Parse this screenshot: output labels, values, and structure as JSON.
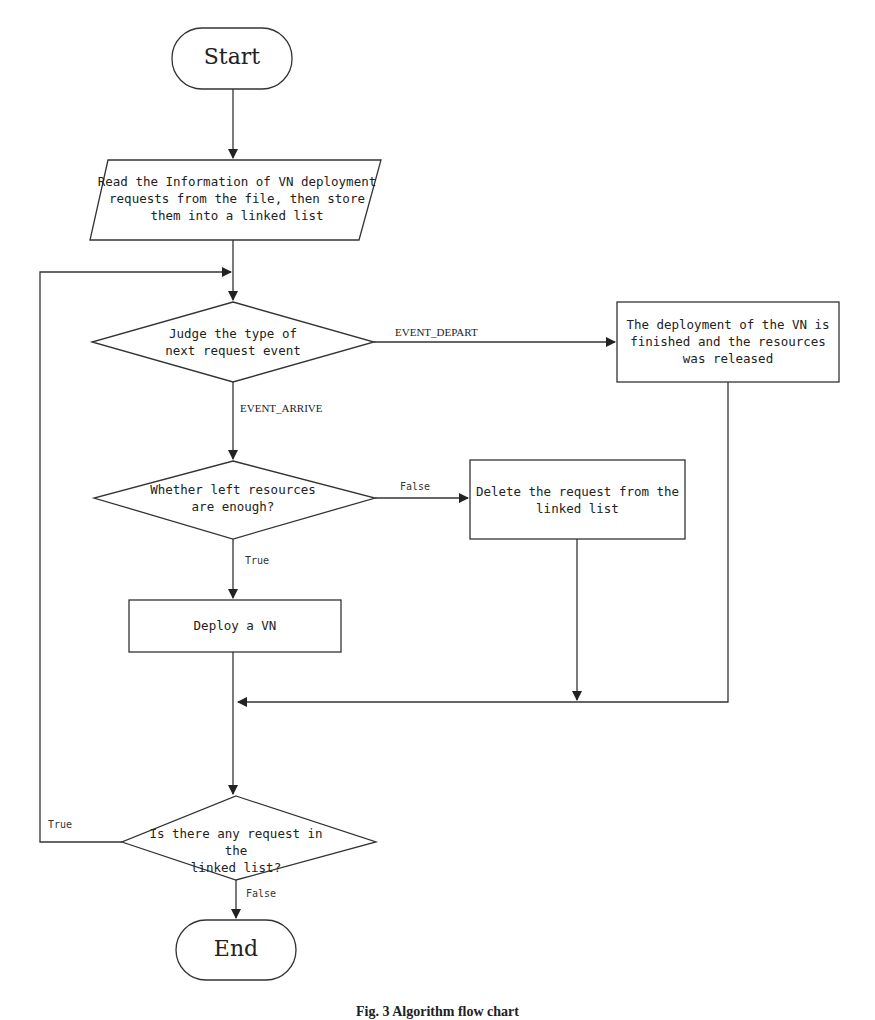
{
  "nodes": {
    "start": {
      "label": "Start",
      "type": "terminal"
    },
    "read": {
      "label": "Read the Information of VN deployment\nrequests from the file, then store\nthem into a linked list",
      "type": "io"
    },
    "judge": {
      "label": "Judge the type of\nnext request event",
      "type": "decision"
    },
    "released": {
      "label": "The deployment of the VN is\nfinished and the resources\nwas released",
      "type": "process"
    },
    "enough": {
      "label": "Whether left resources\nare enough?",
      "type": "decision"
    },
    "delete": {
      "label": "Delete the request from the\nlinked list",
      "type": "process"
    },
    "deploy": {
      "label": "Deploy a VN",
      "type": "process"
    },
    "any": {
      "label": "Is there any request in the\nlinked list?",
      "type": "decision"
    },
    "end": {
      "label": "End",
      "type": "terminal"
    }
  },
  "edges": {
    "event_depart": "EVENT_DEPART",
    "event_arrive": "EVENT_ARRIVE",
    "enough_false": "False",
    "enough_true": "True",
    "any_true": "True",
    "any_false": "False"
  },
  "caption": "Fig. 3  Algorithm flow chart"
}
